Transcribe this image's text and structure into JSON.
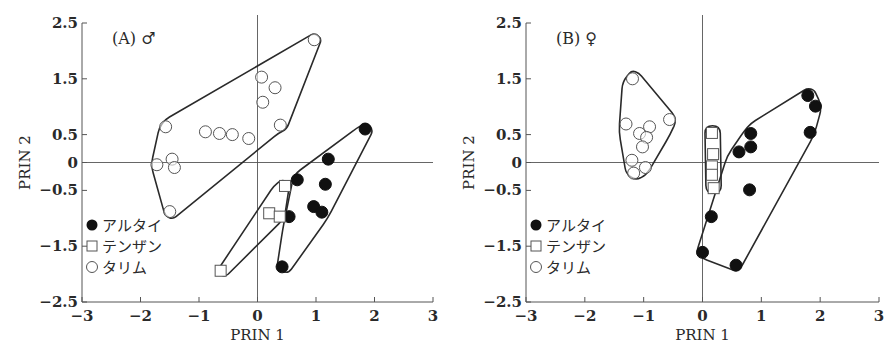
{
  "figure": {
    "panels": [
      {
        "id": "A",
        "label": "(A)",
        "sex_symbol": "♂",
        "xlabel": "PRIN 1",
        "ylabel": "PRIN 2"
      },
      {
        "id": "B",
        "label": "(B)",
        "sex_symbol": "♀",
        "xlabel": "PRIN 1",
        "ylabel": "PRIN 2"
      }
    ],
    "legend": [
      {
        "marker": "filled-circle",
        "label": "アルタイ"
      },
      {
        "marker": "open-square",
        "label": "テンザン"
      },
      {
        "marker": "open-circle",
        "label": "タリム"
      }
    ],
    "x_ticks": [
      "−3",
      "−2",
      "−1",
      "0",
      "1",
      "2",
      "3"
    ],
    "y_ticks": [
      "2.5",
      "1.5",
      "0.5",
      "0",
      "−0.5",
      "−1.5",
      "−2.5"
    ]
  },
  "chart_data": [
    {
      "type": "scatter",
      "title": "(A) ♂",
      "xlabel": "PRIN 1",
      "ylabel": "PRIN 2",
      "xlim": [
        -3,
        3
      ],
      "ylim": [
        -2.5,
        2.5
      ],
      "x_ticks": [
        -3,
        -2,
        -1,
        0,
        1,
        2,
        3
      ],
      "y_ticks": [
        2.5,
        1.5,
        0.5,
        0,
        -0.5,
        -1.5,
        -2.5
      ],
      "zero_lines": true,
      "legend_position": "lower-left",
      "series": [
        {
          "name": "アルタイ",
          "marker": "filled-circle",
          "points": [
            [
              1.84,
              0.6
            ],
            [
              1.21,
              0.06
            ],
            [
              0.68,
              -0.31
            ],
            [
              1.16,
              -0.39
            ],
            [
              0.96,
              -0.79
            ],
            [
              1.1,
              -0.89
            ],
            [
              0.54,
              -0.97
            ],
            [
              0.42,
              -1.87
            ]
          ],
          "hull": [
            [
              1.87,
              0.72
            ],
            [
              1.98,
              0.58
            ],
            [
              1.2,
              -1.0
            ],
            [
              0.52,
              -2.0
            ],
            [
              0.33,
              -1.9
            ],
            [
              0.43,
              -1.2
            ],
            [
              0.62,
              -0.22
            ],
            [
              1.7,
              0.62
            ]
          ]
        },
        {
          "name": "テンザン",
          "marker": "open-square",
          "points": [
            [
              0.47,
              -0.42
            ],
            [
              0.2,
              -0.91
            ],
            [
              0.38,
              -0.97
            ],
            [
              -0.63,
              -1.94
            ]
          ],
          "hull": [
            [
              0.42,
              -0.3
            ],
            [
              0.55,
              -0.38
            ],
            [
              0.46,
              -1.0
            ],
            [
              -0.56,
              -2.06
            ],
            [
              -0.7,
              -1.96
            ],
            [
              0.28,
              -0.42
            ]
          ]
        },
        {
          "name": "タリム",
          "marker": "open-circle",
          "points": [
            [
              0.97,
              2.2
            ],
            [
              0.07,
              1.53
            ],
            [
              0.3,
              1.34
            ],
            [
              0.09,
              1.08
            ],
            [
              0.39,
              0.67
            ],
            [
              -1.57,
              0.64
            ],
            [
              -0.89,
              0.55
            ],
            [
              -0.65,
              0.52
            ],
            [
              -0.43,
              0.5
            ],
            [
              -0.15,
              0.43
            ],
            [
              -1.46,
              0.06
            ],
            [
              -1.72,
              -0.04
            ],
            [
              -1.42,
              -0.09
            ],
            [
              -1.5,
              -0.88
            ]
          ],
          "hull": [
            [
              -1.58,
              0.77
            ],
            [
              0.97,
              2.32
            ],
            [
              1.1,
              2.22
            ],
            [
              0.5,
              0.6
            ],
            [
              0.35,
              0.52
            ],
            [
              -1.45,
              -1.02
            ],
            [
              -1.58,
              -0.95
            ],
            [
              -1.82,
              -0.05
            ],
            [
              -1.68,
              0.62
            ]
          ]
        }
      ]
    },
    {
      "type": "scatter",
      "title": "(B) ♀",
      "xlabel": "PRIN 1",
      "ylabel": "PRIN 2",
      "xlim": [
        -3,
        3
      ],
      "ylim": [
        -2.5,
        2.5
      ],
      "x_ticks": [
        -3,
        -2,
        -1,
        0,
        1,
        2,
        3
      ],
      "y_ticks": [
        2.5,
        1.5,
        0.5,
        0,
        -0.5,
        -1.5,
        -2.5
      ],
      "zero_lines": true,
      "legend_position": "lower-left",
      "series": [
        {
          "name": "アルタイ",
          "marker": "filled-circle",
          "points": [
            [
              1.79,
              1.2
            ],
            [
              1.92,
              1.01
            ],
            [
              1.83,
              0.54
            ],
            [
              0.82,
              0.52
            ],
            [
              0.82,
              0.28
            ],
            [
              0.62,
              0.19
            ],
            [
              0.8,
              -0.49
            ],
            [
              0.15,
              -0.97
            ],
            [
              0.0,
              -1.61
            ],
            [
              0.57,
              -1.84
            ]
          ],
          "hull": [
            [
              1.78,
              1.33
            ],
            [
              1.9,
              1.3
            ],
            [
              2.03,
              1.0
            ],
            [
              1.9,
              0.5
            ],
            [
              0.66,
              -1.87
            ],
            [
              0.58,
              -1.95
            ],
            [
              0.0,
              -1.72
            ],
            [
              -0.1,
              -1.6
            ],
            [
              0.42,
              0.12
            ],
            [
              0.7,
              0.55
            ],
            [
              0.82,
              0.7
            ]
          ]
        },
        {
          "name": "テンザン",
          "marker": "open-square",
          "points": [
            [
              0.16,
              0.53
            ],
            [
              0.18,
              0.15
            ],
            [
              0.16,
              -0.07
            ],
            [
              0.16,
              -0.22
            ],
            [
              0.19,
              -0.46
            ]
          ],
          "hull": [
            [
              0.04,
              0.66
            ],
            [
              0.3,
              0.66
            ],
            [
              0.32,
              -0.55
            ],
            [
              0.06,
              -0.55
            ]
          ]
        },
        {
          "name": "タリム",
          "marker": "open-circle",
          "points": [
            [
              -1.19,
              1.5
            ],
            [
              -1.3,
              0.69
            ],
            [
              -0.56,
              0.77
            ],
            [
              -0.9,
              0.64
            ],
            [
              -1.07,
              0.52
            ],
            [
              -0.95,
              0.45
            ],
            [
              -1.02,
              0.28
            ],
            [
              -1.2,
              0.04
            ],
            [
              -0.97,
              -0.09
            ],
            [
              -1.17,
              -0.19
            ]
          ],
          "hull": [
            [
              -1.2,
              1.65
            ],
            [
              -1.08,
              1.6
            ],
            [
              -0.43,
              0.78
            ],
            [
              -0.55,
              0.5
            ],
            [
              -0.95,
              -0.22
            ],
            [
              -1.14,
              -0.32
            ],
            [
              -1.3,
              -0.2
            ],
            [
              -1.42,
              0.55
            ],
            [
              -1.36,
              1.45
            ]
          ]
        }
      ]
    }
  ]
}
